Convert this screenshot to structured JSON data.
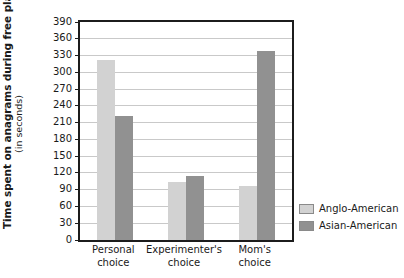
{
  "chart_data": {
    "type": "bar",
    "title": "",
    "subtitle": "",
    "xlabel": "",
    "ylabel": "Time spent on anagrams during free play",
    "ylabel_units": "(in seconds)",
    "categories": [
      "Personal choice",
      "Experimenter's choice",
      "Mom's choice"
    ],
    "category_lines": [
      [
        "Personal",
        "choice"
      ],
      [
        "Experimenter's",
        "choice"
      ],
      [
        "Mom's",
        "choice"
      ]
    ],
    "series": [
      {
        "name": "Anglo-American",
        "color": "#d2d2d2",
        "values": [
          322,
          103,
          97
        ]
      },
      {
        "name": "Asian-American",
        "color": "#919191",
        "values": [
          222,
          115,
          338
        ]
      }
    ],
    "ylim": [
      0,
      390
    ],
    "ytick_values": [
      0,
      30,
      60,
      90,
      120,
      150,
      180,
      210,
      240,
      270,
      300,
      330,
      360,
      390
    ],
    "ytick_labels": [
      "0",
      "30",
      "60",
      "90",
      "120",
      "150",
      "180",
      "210",
      "240",
      "270",
      "300",
      "330",
      "360",
      "390"
    ],
    "grid": true,
    "grid_color": "#c9c9c9",
    "legend_position": "right",
    "frame_color": "#1c1c1c",
    "background": "#ffffff"
  },
  "legend": {
    "entries": [
      {
        "label": "Anglo-American",
        "color": "#d2d2d2"
      },
      {
        "label": "Asian-American",
        "color": "#919191"
      }
    ]
  }
}
